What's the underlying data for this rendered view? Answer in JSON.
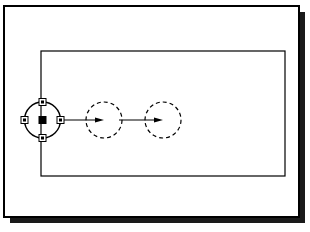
{
  "figure": {
    "title": "CAD drawing: circle copied along horizontal displacement vectors",
    "caption": "",
    "canvas": {
      "width": 310,
      "height": 232,
      "background": "#ffffff"
    }
  },
  "colors": {
    "ink": "#000000",
    "paper": "#ffffff",
    "shadow": "#1a1a1a",
    "grip_fill_hollow": "#ffffff",
    "grip_fill_solid": "#000000"
  },
  "outer_frame": {
    "label": "drawing sheet border",
    "x": 4,
    "y": 6,
    "width": 295,
    "height": 211,
    "stroke_width": 2,
    "shadow_offset": 6,
    "shadow_color": "#1a1a1a"
  },
  "inner_rectangle": {
    "label": "viewport rectangle",
    "x": 41,
    "y": 51,
    "width": 244,
    "height": 125,
    "stroke_width": 1.2
  },
  "axis": {
    "label": "horizontal displacement axis",
    "y": 120
  },
  "circles": [
    {
      "id": "circle-source",
      "label": "source circle (selected)",
      "cx": 42.5,
      "cy": 120,
      "r": 18,
      "style": "solid",
      "stroke_width": 1.4,
      "selected": true
    },
    {
      "id": "circle-copy-1",
      "label": "first copy (preview)",
      "cx": 104,
      "cy": 120,
      "r": 18,
      "style": "dashed",
      "stroke_width": 1.2,
      "dash": "4 3",
      "selected": false
    },
    {
      "id": "circle-copy-2",
      "label": "second copy (preview)",
      "cx": 163,
      "cy": 120,
      "r": 18,
      "style": "dashed",
      "stroke_width": 1.2,
      "dash": "4 3",
      "selected": false
    }
  ],
  "grips": [
    {
      "id": "grip-center",
      "label": "center grip",
      "cx": 42.5,
      "cy": 120,
      "size": 7,
      "fill": "solid"
    },
    {
      "id": "grip-top",
      "label": "top quadrant grip",
      "cx": 42.5,
      "cy": 102,
      "size": 7,
      "fill": "hollow"
    },
    {
      "id": "grip-bottom",
      "label": "bottom quadrant grip",
      "cx": 42.5,
      "cy": 138,
      "size": 7,
      "fill": "hollow"
    },
    {
      "id": "grip-left",
      "label": "left quadrant grip",
      "cx": 24.5,
      "cy": 120,
      "size": 7,
      "fill": "hollow"
    },
    {
      "id": "grip-right",
      "label": "right quadrant grip",
      "cx": 60.5,
      "cy": 120,
      "size": 7,
      "fill": "hollow"
    }
  ],
  "arrows": [
    {
      "id": "arrow-1",
      "label": "displacement vector to first copy",
      "x1": 60.5,
      "y1": 120,
      "x2": 104,
      "y2": 120,
      "stroke_width": 1.2,
      "head_length": 9,
      "head_width": 5
    },
    {
      "id": "arrow-2",
      "label": "displacement vector to second copy",
      "x1": 119,
      "y1": 120,
      "x2": 163,
      "y2": 120,
      "stroke_width": 1.2,
      "head_length": 9,
      "head_width": 5
    }
  ],
  "labels": {
    "none_visible": ""
  }
}
